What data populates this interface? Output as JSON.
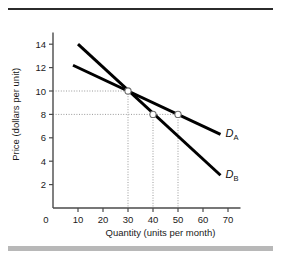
{
  "figure": {
    "top_rule_color": "#2b2b2b",
    "bottom_band_color": "#b8b8b8",
    "background": "#ffffff",
    "cropped_heading": ""
  },
  "chart_data": {
    "type": "line",
    "title": "",
    "xlabel": "Quantity (units per month)",
    "ylabel": "Price (dollars per unit)",
    "xlim": [
      0,
      75
    ],
    "ylim": [
      0,
      15
    ],
    "xticks": [
      0,
      10,
      20,
      30,
      40,
      50,
      60,
      70
    ],
    "xtick_labels": [
      "0",
      "10",
      "20",
      "30",
      "40",
      "50",
      "60",
      "70"
    ],
    "yticks": [
      2,
      4,
      6,
      8,
      10,
      12,
      14
    ],
    "ytick_labels": [
      "2",
      "4",
      "6",
      "8",
      "10",
      "12",
      "14"
    ],
    "grid": false,
    "line_color": "#000000",
    "legend_position": "inline-right",
    "series": [
      {
        "name": "D_A",
        "label": "D",
        "subscript": "A",
        "description": "Less elastic / flatter demand curve",
        "points": [
          {
            "x": 8,
            "y": 12.2
          },
          {
            "x": 30,
            "y": 10.0
          },
          {
            "x": 50,
            "y": 8.0
          },
          {
            "x": 67,
            "y": 6.3
          }
        ],
        "label_x": 69,
        "label_y": 6.1
      },
      {
        "name": "D_B",
        "label": "D",
        "subscript": "B",
        "description": "More elastic / steeper demand curve",
        "points": [
          {
            "x": 10,
            "y": 14.0
          },
          {
            "x": 30,
            "y": 10.0
          },
          {
            "x": 40,
            "y": 8.0
          },
          {
            "x": 67,
            "y": 2.8
          }
        ],
        "label_x": 69,
        "label_y": 2.6
      }
    ],
    "markers": [
      {
        "x": 30,
        "y": 10,
        "style": "open-circle",
        "label": "intersection-point"
      },
      {
        "x": 40,
        "y": 8,
        "style": "open-circle",
        "label": "point-on-DB"
      },
      {
        "x": 50,
        "y": 8,
        "style": "open-circle",
        "label": "point-on-DA"
      }
    ],
    "guide_lines": {
      "style": "dotted",
      "color": "#9a9a9a",
      "horizontal": [
        10,
        8
      ],
      "vertical": [
        30,
        40,
        50
      ]
    },
    "annotations": []
  }
}
